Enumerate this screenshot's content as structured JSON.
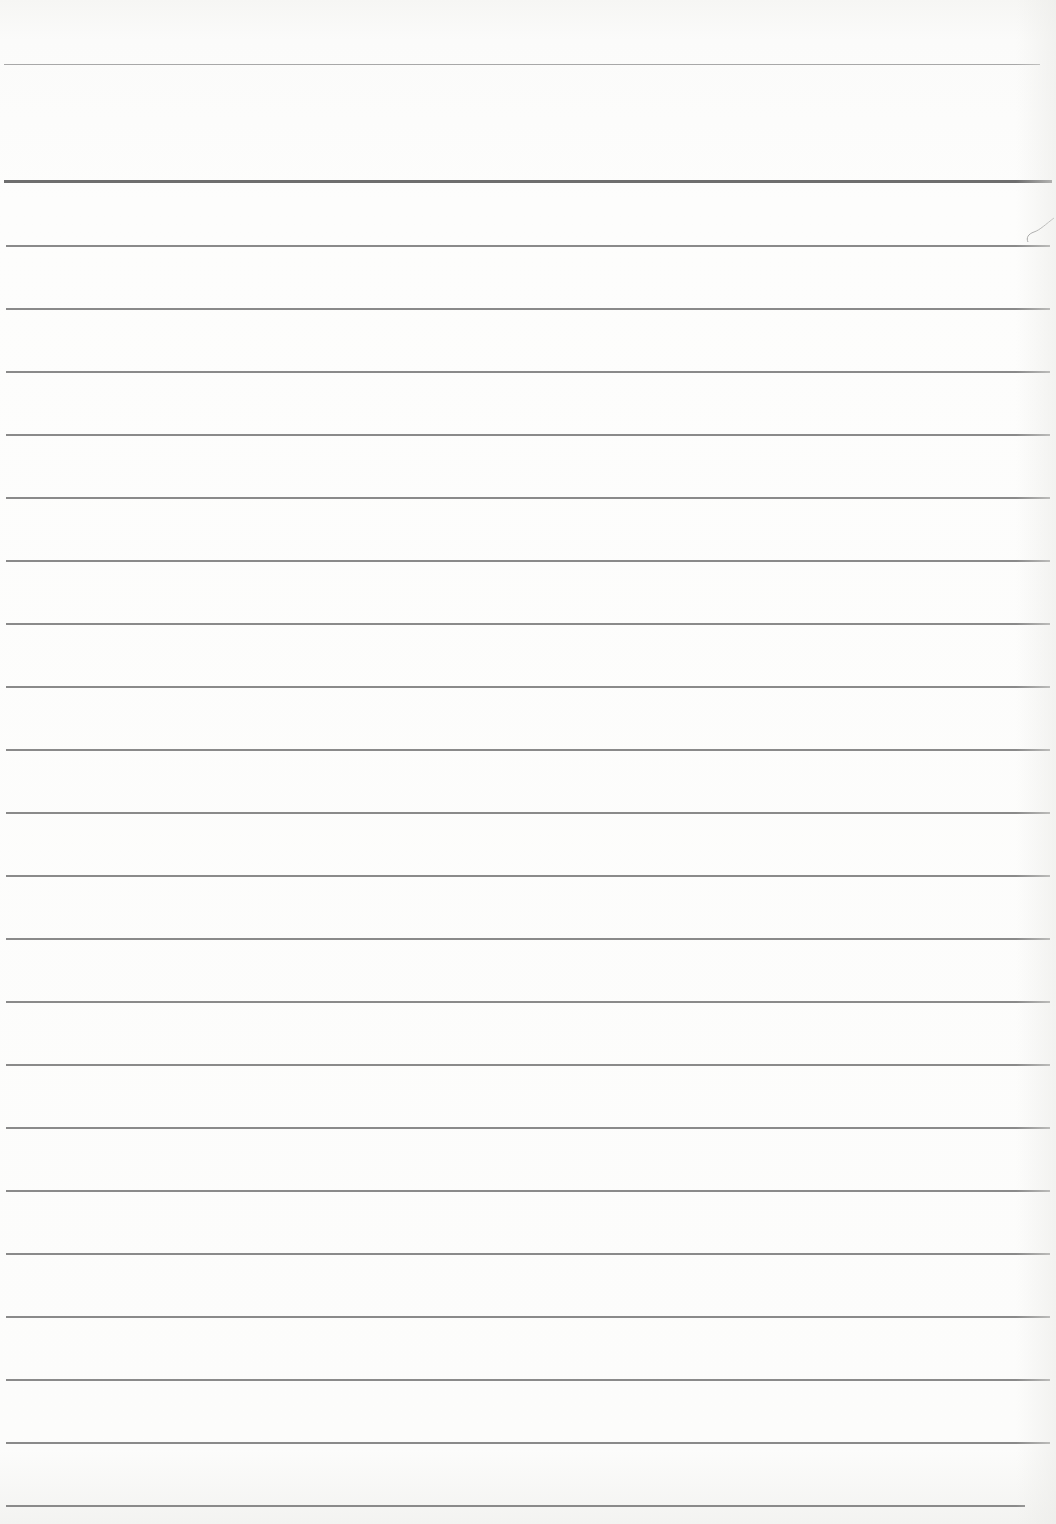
{
  "document": {
    "type": "ruled-notebook-page",
    "text_content": "",
    "colors": {
      "paper": "#fdfdfc",
      "rule": "#8a8a8a",
      "header_rule": "#6e6e6e",
      "top_rule": "#a8a8a8"
    },
    "top_rule": {
      "y": 65,
      "x_end": 1040
    },
    "header_rule": {
      "y": 181,
      "x_end": 1052
    },
    "body_rules": {
      "start_y": 245,
      "spacing": 63,
      "count": 21,
      "x_end": 1050,
      "last_x_end": 1025
    }
  }
}
